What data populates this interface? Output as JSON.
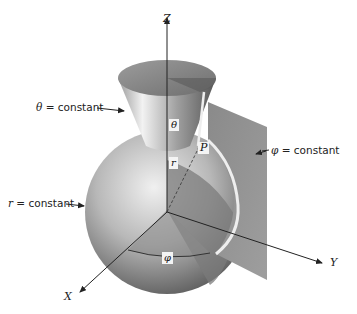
{
  "figure": {
    "axes": {
      "z": "Z",
      "x": "X",
      "y": "Y"
    },
    "labels": {
      "theta_surface": {
        "symbol": "θ",
        "text": " = constant"
      },
      "phi_surface": {
        "symbol": "φ",
        "text": " = constant"
      },
      "r_surface": {
        "symbol": "r",
        "text": " = constant"
      }
    },
    "tags": {
      "theta": "θ",
      "r": "r",
      "point": "P",
      "phi": "φ"
    },
    "colors": {
      "ink": "#222222",
      "surface_dark": "#6a6a6a",
      "surface_light": "#d8d8d8",
      "background": "#ffffff"
    }
  }
}
